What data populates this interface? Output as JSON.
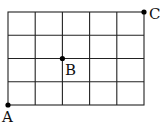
{
  "diagram": {
    "type": "grid",
    "columns": 5,
    "rows": 4,
    "points": [
      {
        "label": "A",
        "grid_x": 0,
        "grid_y": 0
      },
      {
        "label": "B",
        "grid_x": 2,
        "grid_y": 2
      },
      {
        "label": "C",
        "grid_x": 5,
        "grid_y": 4
      }
    ],
    "line_color": "#222222",
    "point_color": "#000000"
  }
}
